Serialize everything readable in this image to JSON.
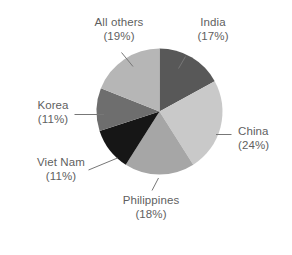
{
  "chart_data": {
    "type": "pie",
    "title": "",
    "subtitle": "",
    "xlabel": "",
    "ylabel": "",
    "legend_position": "none",
    "grid": false,
    "label_format": "name (pct%)",
    "start_angle_deg": 0,
    "direction": "clockwise",
    "categories": [
      "India",
      "China",
      "Philippines",
      "Viet Nam",
      "Korea",
      "All others"
    ],
    "values": [
      17,
      24,
      18,
      11,
      11,
      19
    ],
    "units": "percent",
    "slices": [
      {
        "label": "India",
        "pct_text": "(17%)",
        "value": 17,
        "color": "#585858"
      },
      {
        "label": "China",
        "pct_text": "(24%)",
        "value": 24,
        "color": "#c9c9c9"
      },
      {
        "label": "Philippines",
        "pct_text": "(18%)",
        "value": 18,
        "color": "#a6a6a6"
      },
      {
        "label": "Viet Nam",
        "pct_text": "(11%)",
        "value": 11,
        "color": "#161616"
      },
      {
        "label": "Korea",
        "pct_text": "(11%)",
        "value": 11,
        "color": "#6e6e6e"
      },
      {
        "label": "All others",
        "pct_text": "(19%)",
        "value": 19,
        "color": "#b6b6b6"
      }
    ]
  },
  "labels": {
    "india": {
      "name": "India",
      "pct": "(17%)"
    },
    "china": {
      "name": "China",
      "pct": "(24%)"
    },
    "philippines": {
      "name": "Philippines",
      "pct": "(18%)"
    },
    "viet_nam": {
      "name": "Viet Nam",
      "pct": "(11%)"
    },
    "korea": {
      "name": "Korea",
      "pct": "(11%)"
    },
    "all_others": {
      "name": "All others",
      "pct": "(19%)"
    }
  },
  "colors": {
    "background": "#ffffff",
    "text": "#5f5f5f",
    "leader_line": "#777777"
  }
}
